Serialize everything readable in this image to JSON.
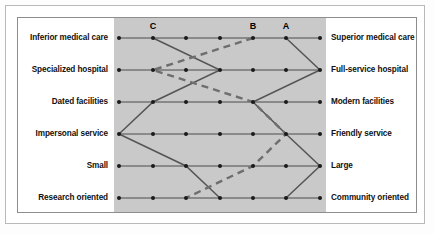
{
  "figure": {
    "kind": "semantic-differential-snake-plot",
    "background": "#fdfdfd",
    "plot_band_color": "#c9c9c9",
    "frame_color": "#8d8d8d",
    "line_color": "#555555"
  },
  "column_headers": [
    {
      "label": "C",
      "column_index": 2,
      "x": 153
    },
    {
      "label": "B",
      "column_index": 5,
      "x": 253
    },
    {
      "label": "A",
      "column_index": 6,
      "x": 286
    }
  ],
  "chart_data": {
    "type": "line",
    "title": "",
    "subtitle": "",
    "xlabel": "",
    "ylabel": "",
    "grid": true,
    "legend_position": "top-inside",
    "scale_points": 7,
    "xlim": [
      1,
      7
    ],
    "categories": [
      "Inferior medical care / Superior medical care",
      "Specialized hospital / Full-service hospital",
      "Dated facilities / Modern facilities",
      "Impersonal service / Friendly service",
      "Small / Large",
      "Research oriented / Community oriented"
    ],
    "left_labels": [
      "Inferior medical care",
      "Specialized hospital",
      "Dated facilities",
      "Impersonal service",
      "Small",
      "Research oriented"
    ],
    "right_labels": [
      "Superior medical care",
      "Full-service hospital",
      "Modern facilities",
      "Friendly service",
      "Large",
      "Community oriented"
    ],
    "series": [
      {
        "name": "A",
        "style": "solid",
        "color": "#555555",
        "values": [
          6,
          7,
          5,
          6,
          7,
          6
        ]
      },
      {
        "name": "B",
        "style": "solid",
        "color": "#555555",
        "values": [
          2,
          4,
          2,
          1,
          3,
          4
        ]
      },
      {
        "name": "C",
        "style": "dashed",
        "color": "#6e6e6e",
        "values": [
          5,
          2,
          5,
          6,
          5,
          3
        ]
      }
    ]
  },
  "geometry": {
    "row_y": [
      38,
      70,
      102,
      134,
      166,
      198
    ],
    "col_x": [
      119,
      153,
      186,
      220,
      253,
      286,
      320
    ],
    "dot_radius": 2,
    "left_label_x": 108,
    "right_label_x": 331,
    "header_y": 26
  }
}
